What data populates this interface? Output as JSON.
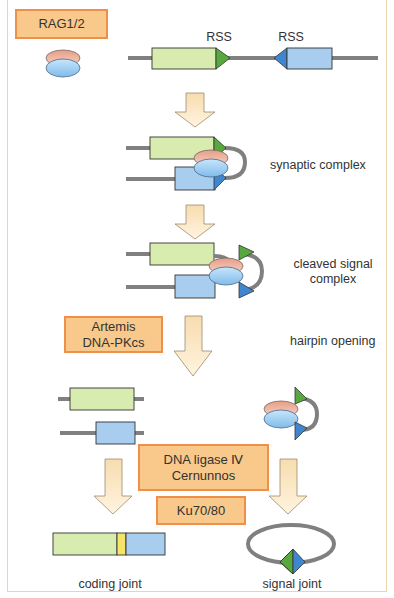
{
  "diagram": {
    "colors": {
      "frame": "#ecd3b4",
      "enzyme_box_fill": "#f8c98a",
      "enzyme_box_border": "#f08f4a",
      "coding_segment_green": "#d8ecb0",
      "coding_segment_blue": "#a8cdef",
      "rss_green": "#58a840",
      "rss_blue": "#3f86cf",
      "rag_top": "#eab8a4",
      "rag_bottom": "#9ecdf0",
      "dna_line": "#808080",
      "arrow_fill": "#fbe6c4",
      "junction_yellow": "#f4e46a"
    },
    "enzymes": {
      "rag": "RAG1/2",
      "artemis_line1": "Artemis",
      "artemis_line2": "DNA-PKcs",
      "ligase_line1": "DNA ligase Ⅳ",
      "ligase_line2": "Cernunnos",
      "ku": "Ku70/80"
    },
    "labels": {
      "rss_left": "RSS",
      "rss_right": "RSS",
      "synaptic": "synaptic complex",
      "cleaved_line1": "cleaved signal",
      "cleaved_line2": "complex",
      "hairpin": "hairpin opening",
      "coding_joint": "coding joint",
      "signal_joint": "signal joint"
    },
    "steps": [
      "initial RSS-flanked gene segments",
      "synaptic complex",
      "cleaved signal complex",
      "hairpin opening",
      "joining",
      "coding joint / signal joint"
    ]
  }
}
